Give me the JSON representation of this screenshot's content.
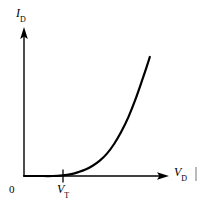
{
  "figure": {
    "background_color": "#ffffff",
    "ink_color": "#000000"
  },
  "chart_data": {
    "type": "line",
    "title": "",
    "subtitle": "",
    "xlabel": "V_D",
    "ylabel": "I_D",
    "xlabel_display": "V",
    "xlabel_subscript": "D",
    "ylabel_display": "I",
    "ylabel_subscript": "D",
    "grid": false,
    "legend": null,
    "legend_position": "none",
    "axis_style": "arrow-headed half-axes through origin",
    "xlim": [
      0,
      1
    ],
    "ylim": [
      0,
      1
    ],
    "x_tick_labels": [
      "0",
      "V_T"
    ],
    "y_tick_labels": [],
    "annotations": [
      {
        "name": "origin-label",
        "text": "0",
        "x_norm": 0.0,
        "y_norm": 0.0
      },
      {
        "name": "threshold-tick-label",
        "text": "V",
        "subscript": "T",
        "x_norm": 0.27,
        "y_norm": 0.0,
        "description": "threshold voltage tick on horizontal axis"
      }
    ],
    "series": [
      {
        "name": "diode forward characteristic",
        "description": "Exponential diode current versus diode voltage; current is essentially zero until the threshold voltage V_T, then rises steeply.",
        "color": "#000000",
        "line_width": 2.2,
        "x": [
          0.0,
          0.1,
          0.2,
          0.27,
          0.33,
          0.38,
          0.43,
          0.48,
          0.53,
          0.58,
          0.63,
          0.68,
          0.73,
          0.78,
          0.83,
          0.86,
          0.88
        ],
        "y": [
          0.0,
          0.0,
          0.0,
          0.005,
          0.015,
          0.03,
          0.05,
          0.08,
          0.12,
          0.175,
          0.25,
          0.345,
          0.46,
          0.6,
          0.76,
          0.86,
          0.93
        ]
      }
    ],
    "threshold": {
      "name": "V_T",
      "x_norm": 0.27
    }
  },
  "marks": {
    "right_edge_tick": {
      "name": "right-edge-tick",
      "description": "small faint vertical rule near the right edge below the axis label"
    }
  }
}
